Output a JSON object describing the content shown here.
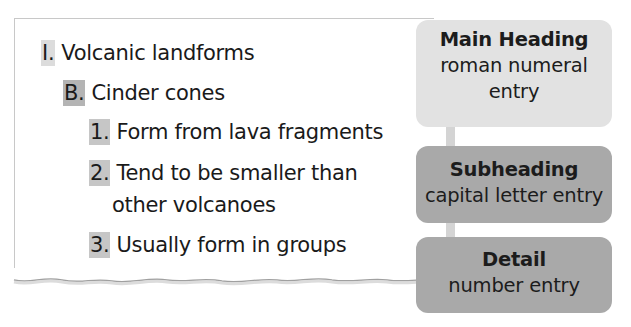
{
  "outline": {
    "lines": [
      {
        "level": 1,
        "marker": "I.",
        "text": "Volcanic landforms"
      },
      {
        "level": 2,
        "marker": "B.",
        "text": "Cinder cones"
      },
      {
        "level": 3,
        "marker": "1.",
        "text": "Form from lava fragments"
      },
      {
        "level": 3,
        "marker": "2.",
        "text": "Tend to be smaller than",
        "continuation": "other volcanoes"
      },
      {
        "level": 3,
        "marker": "3.",
        "text": "Usually form in groups"
      }
    ]
  },
  "legend": {
    "main": {
      "title": "Main Heading",
      "desc_line1": "roman numeral",
      "desc_line2": "entry",
      "color": "#e2e2e2"
    },
    "sub": {
      "title": "Subheading",
      "desc": "capital letter entry",
      "color": "#a9a9a9"
    },
    "detail": {
      "title": "Detail",
      "desc": "number entry",
      "color": "#a9a9a9"
    }
  }
}
